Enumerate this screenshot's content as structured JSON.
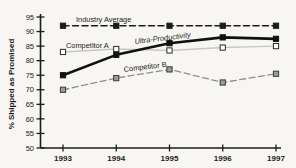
{
  "figure": {
    "background_color": "#f7f6f3",
    "axis_color": "#1c1c1c",
    "text_color": "#222222"
  },
  "chart_data": {
    "type": "line",
    "title": "",
    "xlabel": "",
    "ylabel": "% Shipped as Promised",
    "categories": [
      "1993",
      "1994",
      "1995",
      "1996",
      "1997"
    ],
    "ylim": [
      50,
      95
    ],
    "yticks": [
      50,
      55,
      60,
      65,
      70,
      75,
      80,
      85,
      90,
      95
    ],
    "grid": false,
    "legend_position": "inline-annotations",
    "axis_color": "#1c1c1c",
    "text_color": "#222222",
    "layout": {
      "left": 40.5,
      "top": 17,
      "bottom": 148,
      "right_end": 281,
      "x_first": 63,
      "x_step": 53.25
    },
    "series": [
      {
        "name": "Industry Average",
        "values": [
          92,
          92,
          92,
          92,
          92
        ],
        "line": "dashed",
        "width": 1.5,
        "color": "#1c1c1c",
        "marker": "filled-square",
        "marker_fill": "#1c1c1c",
        "marker_stroke": "#1c1c1c",
        "label": {
          "x": 76,
          "y": 22,
          "rotate": 0,
          "italic": false
        }
      },
      {
        "name": "Competitor A",
        "values": [
          83,
          84,
          83.5,
          84.5,
          85
        ],
        "line": "solid",
        "width": 1.4,
        "color": "#c8c8c8",
        "marker": "open-square",
        "marker_fill": "#ffffff",
        "marker_stroke": "#2a2a2a",
        "label": {
          "x": 66,
          "y": 48,
          "rotate": 0,
          "italic": false
        }
      },
      {
        "name": "Competitor B",
        "values": [
          70,
          74,
          77,
          72.5,
          75.5
        ],
        "line": "dashed",
        "width": 1.3,
        "color": "#8f8f8f",
        "marker": "gray-square",
        "marker_fill": "#9c9c9c",
        "marker_stroke": "#3a3a3a",
        "label": {
          "x": 124,
          "y": 72,
          "rotate": -7,
          "italic": false
        }
      },
      {
        "name": "Ultra-Productivity",
        "values": [
          75,
          82,
          86,
          88,
          87.5
        ],
        "line": "solid",
        "width": 2.6,
        "color": "#111111",
        "marker": "filled-square",
        "marker_fill": "#111111",
        "marker_stroke": "#111111",
        "label": {
          "x": 135,
          "y": 44,
          "rotate": -7,
          "italic": true
        }
      }
    ]
  }
}
